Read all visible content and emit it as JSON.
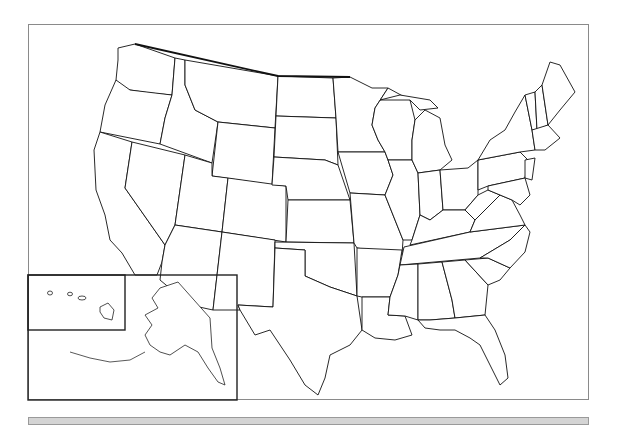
{
  "map": {
    "title": "",
    "type": "blank-outline-map",
    "region": "United States",
    "frame_color": "#8a8a8a",
    "stroke_color": "#111111",
    "fill_color": "#ffffff",
    "inset": {
      "contains": [
        "Alaska",
        "Hawaii"
      ],
      "labels_shown": false
    },
    "state_labels_shown": false
  },
  "bottom_bar": {
    "color": "#d4d4d4",
    "text": ""
  }
}
